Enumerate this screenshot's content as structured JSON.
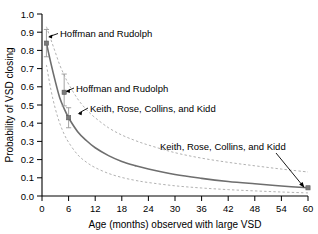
{
  "chart_data": {
    "type": "line",
    "title": "",
    "xlabel": "Age (months) observed with large VSD",
    "ylabel": "Probability of VSD closing",
    "xlim": [
      0,
      60
    ],
    "ylim": [
      0.0,
      1.0
    ],
    "grid": false,
    "legend_position": "none",
    "xticks": [
      0,
      6,
      12,
      18,
      24,
      30,
      36,
      42,
      48,
      54,
      60
    ],
    "xtick_labels": [
      "0",
      "6",
      "12",
      "18",
      "24",
      "30",
      "36",
      "42",
      "48",
      "54",
      "60"
    ],
    "yticks": [
      0.0,
      0.1,
      0.2,
      0.3,
      0.4,
      0.5,
      0.6,
      0.7,
      0.8,
      0.9,
      1.0
    ],
    "ytick_labels": [
      "0.0",
      "0.1",
      "0.2",
      "0.3",
      "0.4",
      "0.5",
      "0.6",
      "0.7",
      "0.8",
      "0.9",
      "1.0"
    ],
    "series": [
      {
        "name": "Fitted probability of VSD closing",
        "style": "solid",
        "color": "#6e6e6e",
        "x": [
          1,
          2,
          3,
          4,
          5,
          6,
          8,
          10,
          12,
          15,
          18,
          21,
          24,
          30,
          36,
          42,
          48,
          54,
          60
        ],
        "values": [
          0.84,
          0.73,
          0.63,
          0.54,
          0.48,
          0.43,
          0.355,
          0.305,
          0.265,
          0.222,
          0.19,
          0.167,
          0.148,
          0.118,
          0.097,
          0.08,
          0.067,
          0.055,
          0.045
        ]
      },
      {
        "name": "Upper confidence band",
        "style": "dashed",
        "color": "#a8a8a8",
        "x": [
          1,
          2,
          3,
          4,
          5,
          6,
          8,
          10,
          12,
          15,
          18,
          21,
          24,
          30,
          36,
          42,
          48,
          54,
          60
        ],
        "values": [
          0.93,
          0.86,
          0.79,
          0.72,
          0.665,
          0.615,
          0.535,
          0.475,
          0.43,
          0.375,
          0.335,
          0.305,
          0.28,
          0.238,
          0.208,
          0.185,
          0.166,
          0.148,
          0.132
        ]
      },
      {
        "name": "Lower confidence band",
        "style": "dashed",
        "color": "#a8a8a8",
        "x": [
          1,
          2,
          3,
          4,
          5,
          6,
          8,
          10,
          12,
          15,
          18,
          21,
          24,
          30,
          36,
          42,
          48,
          54,
          60
        ],
        "values": [
          0.72,
          0.585,
          0.48,
          0.4,
          0.34,
          0.295,
          0.228,
          0.186,
          0.156,
          0.124,
          0.102,
          0.086,
          0.074,
          0.056,
          0.044,
          0.035,
          0.028,
          0.022,
          0.017
        ]
      }
    ],
    "points": [
      {
        "label": "Hoffman and Rudolph",
        "x": 1,
        "y": 0.84,
        "err_low": 0.075,
        "err_high": 0.075
      },
      {
        "label": "Hoffman and Rudolph",
        "x": 5,
        "y": 0.57,
        "err_low": 0.075,
        "err_high": 0.1
      },
      {
        "label": "Keith, Rose, Collins, and Kidd",
        "x": 6,
        "y": 0.43,
        "err_low": 0.055,
        "err_high": 0.055
      },
      {
        "label": "Keith, Rose, Collins, and Kidd",
        "x": 60,
        "y": 0.045,
        "err_low": 0.0,
        "err_high": 0.0
      }
    ],
    "annotations": [
      {
        "text": "Hoffman and Rudolph",
        "id": "annot-hoffman-1"
      },
      {
        "text": "Hoffman and Rudolph",
        "id": "annot-hoffman-2"
      },
      {
        "text": "Keith, Rose, Collins, and Kidd",
        "id": "annot-keith-1"
      },
      {
        "text": "Keith, Rose, Collins, and Kidd",
        "id": "annot-keith-2"
      }
    ]
  }
}
